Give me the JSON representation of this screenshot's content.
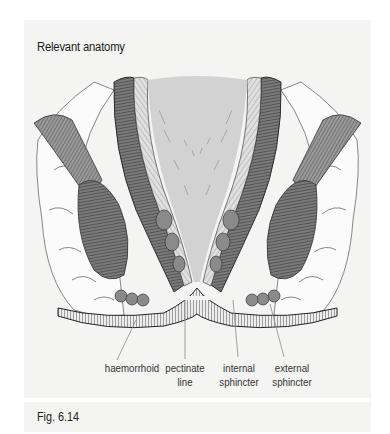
{
  "figure": {
    "title": "Relevant anatomy",
    "caption": "Fig. 6.14",
    "illustration": "anatomy-cross-section-anal-canal",
    "labels": [
      {
        "id": "haemorrhoid",
        "lines": [
          "haemorrhoid"
        ]
      },
      {
        "id": "pectinate-line",
        "lines": [
          "pectinate",
          "line"
        ]
      },
      {
        "id": "internal-sphincter",
        "lines": [
          "internal",
          "sphincter"
        ]
      },
      {
        "id": "external-sphincter",
        "lines": [
          "external",
          "sphincter"
        ]
      }
    ]
  },
  "colors": {
    "panel_bg": "#f4f4f3",
    "lumen": "#d2d2d2",
    "muscle_dark": "#555555",
    "muscle_mid": "#8a8a8a",
    "fat": "#fbfbfb",
    "text": "#1a1a1a",
    "leader": "#8c8c8c"
  }
}
